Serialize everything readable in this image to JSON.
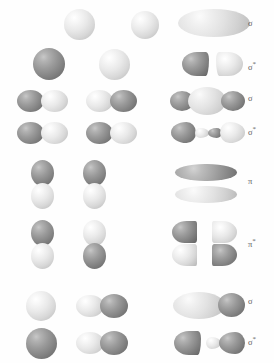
{
  "diagram": {
    "colors": {
      "background": "#ffffff",
      "phase_positive": "#e6e6e6",
      "phase_negative": "#8c8c8c",
      "label_text": "#5d5d5d"
    },
    "rows": [
      {
        "id": "s-s-sigma",
        "label": "σ",
        "label_star": false,
        "combination": "s + s  (in-phase)",
        "atomic_orbitals": [
          {
            "type": "s-sphere",
            "phase": "positive"
          },
          {
            "type": "s-sphere",
            "phase": "positive"
          }
        ],
        "molecular_orbital": "sigma-bonding-ellipse"
      },
      {
        "id": "s-s-sigma-star",
        "label": "σ",
        "label_star": true,
        "combination": "s + s  (out-of-phase)",
        "atomic_orbitals": [
          {
            "type": "s-sphere",
            "phase": "negative"
          },
          {
            "type": "s-sphere",
            "phase": "positive"
          }
        ],
        "molecular_orbital": "sigma-antibonding-two-cones"
      },
      {
        "id": "p-p-sigma",
        "label": "σ",
        "label_star": false,
        "combination": "p + p end-on  (in-phase)",
        "atomic_orbitals": [
          {
            "type": "p-horizontal",
            "phase_left": "negative",
            "phase_right": "positive"
          },
          {
            "type": "p-horizontal",
            "phase_left": "positive",
            "phase_right": "negative"
          }
        ],
        "molecular_orbital": "sigma-bonding-three-lobe"
      },
      {
        "id": "p-p-sigma-star",
        "label": "σ",
        "label_star": true,
        "combination": "p + p end-on  (out-of-phase)",
        "atomic_orbitals": [
          {
            "type": "p-horizontal",
            "phase_left": "negative",
            "phase_right": "positive"
          },
          {
            "type": "p-horizontal",
            "phase_left": "negative",
            "phase_right": "positive"
          }
        ],
        "molecular_orbital": "sigma-antibonding-four-lobe"
      },
      {
        "id": "p-p-pi",
        "label": "π",
        "label_star": false,
        "combination": "p + p side-on  (in-phase)",
        "atomic_orbitals": [
          {
            "type": "p-vertical",
            "phase_top": "negative",
            "phase_bottom": "positive"
          },
          {
            "type": "p-vertical",
            "phase_top": "negative",
            "phase_bottom": "positive"
          }
        ],
        "molecular_orbital": "pi-bonding-two-sausages"
      },
      {
        "id": "p-p-pi-star",
        "label": "π",
        "label_star": true,
        "combination": "p + p side-on  (out-of-phase)",
        "atomic_orbitals": [
          {
            "type": "p-vertical",
            "phase_top": "negative",
            "phase_bottom": "positive"
          },
          {
            "type": "p-vertical",
            "phase_top": "positive",
            "phase_bottom": "negative"
          }
        ],
        "molecular_orbital": "pi-antibonding-four-wedges"
      },
      {
        "id": "s-p-sigma",
        "label": "σ",
        "label_star": false,
        "combination": "s + p  (in-phase)",
        "atomic_orbitals": [
          {
            "type": "s-sphere",
            "phase": "positive"
          },
          {
            "type": "p-horizontal",
            "phase_left": "positive",
            "phase_right": "negative"
          }
        ],
        "molecular_orbital": "sigma-bonding-sp-lobe"
      },
      {
        "id": "s-p-sigma-star",
        "label": "σ",
        "label_star": true,
        "combination": "s + p  (out-of-phase)",
        "atomic_orbitals": [
          {
            "type": "s-sphere",
            "phase": "negative"
          },
          {
            "type": "p-horizontal",
            "phase_left": "positive",
            "phase_right": "negative"
          }
        ],
        "molecular_orbital": "sigma-antibonding-sp-lobes"
      }
    ]
  }
}
